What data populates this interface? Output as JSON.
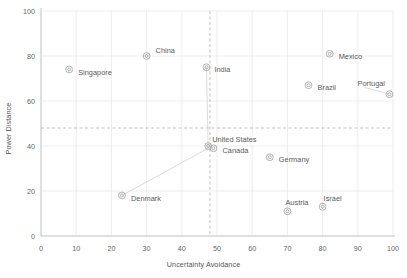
{
  "chart_data": {
    "type": "scatter",
    "title": "",
    "xlabel": "Uncertainty Avoidance",
    "ylabel": "Power Distance",
    "xlim": [
      0,
      100
    ],
    "ylim": [
      0,
      100
    ],
    "xticks": [
      0,
      10,
      20,
      30,
      40,
      50,
      60,
      70,
      80,
      90,
      100
    ],
    "yticks": [
      0,
      20,
      40,
      60,
      80,
      100
    ],
    "grid": true,
    "legend": "none",
    "marker_color": "#9a9a9a",
    "grid_color": "#e8e8e8",
    "axis_color": "#c9c9c9",
    "label_color": "#5a5a5a",
    "reference_lines": [
      {
        "axis": "y",
        "value": 48,
        "style": "dashed",
        "color": "#b9b9b9"
      },
      {
        "axis": "x",
        "value": 48,
        "style": "dashed",
        "color": "#b9b9b9"
      }
    ],
    "points": [
      {
        "name": "Singapore",
        "x": 8,
        "y": 74,
        "label_dx": 9,
        "label_dy": 2.5,
        "leader": false
      },
      {
        "name": "China",
        "x": 30,
        "y": 80,
        "label_dx": 9,
        "label_dy": -6,
        "leader": false
      },
      {
        "name": "India",
        "x": 47,
        "y": 75,
        "label_dx": 8,
        "label_dy": 2.5,
        "leader": true,
        "leader_to_x": 47.5,
        "leader_to_y": 39
      },
      {
        "name": "Mexico",
        "x": 82,
        "y": 81,
        "label_dx": 9,
        "label_dy": 2.5,
        "leader": false
      },
      {
        "name": "Brazil",
        "x": 76,
        "y": 67,
        "label_dx": 9,
        "label_dy": 2.5,
        "leader": false
      },
      {
        "name": "Portugal",
        "x": 99,
        "y": 63,
        "label_dx": -32,
        "label_dy": -11,
        "leader": true,
        "leader_to_x": 92,
        "leader_to_y": 66
      },
      {
        "name": "United States",
        "x": 47.5,
        "y": 40,
        "label_dx": 4,
        "label_dy": -7,
        "leader": false
      },
      {
        "name": "Canada",
        "x": 49,
        "y": 39,
        "label_dx": 9,
        "label_dy": 2.5,
        "leader": false
      },
      {
        "name": "Germany",
        "x": 65,
        "y": 35,
        "label_dx": 9,
        "label_dy": 2.5,
        "leader": false
      },
      {
        "name": "Denmark",
        "x": 23,
        "y": 18,
        "label_dx": 9,
        "label_dy": 2.5,
        "leader": true,
        "leader_to_x": 47.5,
        "leader_to_y": 39
      },
      {
        "name": "Austria",
        "x": 70,
        "y": 11,
        "label_dx": -2,
        "label_dy": -9,
        "leader": false
      },
      {
        "name": "Israel",
        "x": 80,
        "y": 13,
        "label_dx": 1,
        "label_dy": -8,
        "leader": false
      }
    ]
  }
}
